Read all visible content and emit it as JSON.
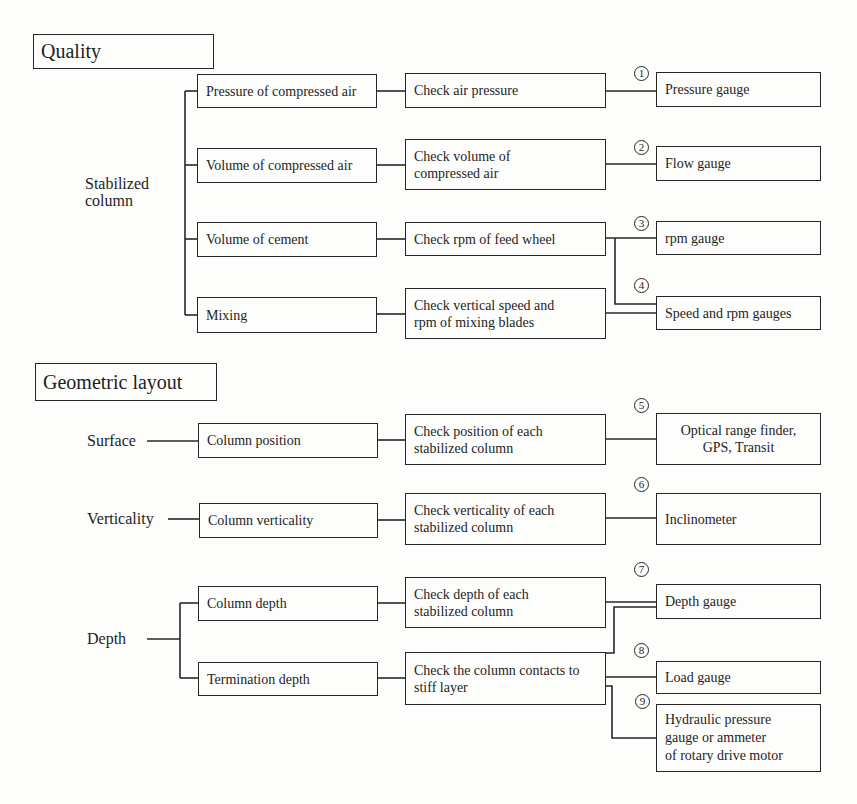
{
  "quality": {
    "title": "Quality",
    "group_label": "Stabilized column",
    "rows": [
      {
        "item": "Pressure of compressed air",
        "check": "Check air pressure",
        "numbers": [
          "1"
        ],
        "tools": [
          "Pressure gauge"
        ]
      },
      {
        "item": "Volume of compressed air",
        "check": "Check volume of\ncompressed air",
        "numbers": [
          "2"
        ],
        "tools": [
          "Flow gauge"
        ]
      },
      {
        "item": "Volume of cement",
        "check": "Check rpm of feed wheel",
        "numbers": [
          "3"
        ],
        "tools": [
          "rpm gauge"
        ]
      },
      {
        "item": "Mixing",
        "check": "Check vertical speed and\nrpm of mixing blades",
        "numbers": [
          "4"
        ],
        "tools": [
          "Speed and rpm gauges"
        ]
      }
    ]
  },
  "geometric": {
    "title": "Geometric layout",
    "groups": [
      {
        "label": "Surface",
        "item": "Column position",
        "check": "Check position of each\nstabilized column",
        "number": "5",
        "tool": "Optical range finder,\nGPS,  Transit"
      },
      {
        "label": "Verticality",
        "item": "Column verticality",
        "check": "Check verticality of each\nstabilized column",
        "number": "6",
        "tool": "Inclinometer"
      },
      {
        "label": "Depth",
        "items": [
          {
            "item": "Column depth",
            "check": "Check depth of each\nstabilized column"
          },
          {
            "item": "Termination depth",
            "check": "Check the column contacts to\nstiff layer"
          }
        ],
        "numbers": [
          "7",
          "8",
          "9"
        ],
        "tools": [
          "Depth gauge",
          "Load gauge",
          "Hydraulic pressure\ngauge or ammeter\nof rotary drive motor"
        ]
      }
    ]
  }
}
